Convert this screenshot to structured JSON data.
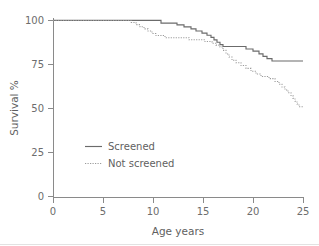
{
  "chart_data": {
    "type": "line",
    "title": "",
    "subtitle": "",
    "xlabel": "Age years",
    "ylabel": "Survival %",
    "xlim": [
      0,
      25
    ],
    "ylim": [
      0,
      100
    ],
    "xticks": [
      0,
      5,
      10,
      15,
      20,
      25
    ],
    "yticks": [
      0,
      25,
      50,
      75,
      100
    ],
    "xtick_labels": [
      "0",
      "5",
      "10",
      "15",
      "20",
      "25"
    ],
    "ytick_labels": [
      "0",
      "25",
      "50",
      "75",
      "100"
    ],
    "grid": false,
    "legend_position": "center-left",
    "style": "kaplan-meier step curves",
    "series": [
      {
        "name": "Screened",
        "line_style": "solid",
        "color": "#6b6b6b",
        "final_value": 77,
        "points": [
          [
            0,
            100
          ],
          [
            10.8,
            100
          ],
          [
            10.8,
            98.5
          ],
          [
            12.4,
            98.5
          ],
          [
            12.4,
            97.5
          ],
          [
            13.1,
            97.5
          ],
          [
            13.1,
            96.3
          ],
          [
            13.8,
            96.3
          ],
          [
            13.8,
            95.2
          ],
          [
            14.3,
            95.2
          ],
          [
            14.3,
            94.0
          ],
          [
            14.9,
            94.0
          ],
          [
            14.9,
            92.8
          ],
          [
            15.4,
            92.8
          ],
          [
            15.4,
            91.6
          ],
          [
            15.8,
            91.6
          ],
          [
            15.8,
            90.4
          ],
          [
            16.1,
            90.4
          ],
          [
            16.1,
            89.0
          ],
          [
            16.4,
            89.0
          ],
          [
            16.4,
            87.6
          ],
          [
            16.7,
            87.6
          ],
          [
            16.7,
            86.3
          ],
          [
            17.0,
            86.3
          ],
          [
            17.0,
            85.2
          ],
          [
            19.3,
            85.2
          ],
          [
            19.3,
            83.8
          ],
          [
            20.0,
            83.8
          ],
          [
            20.0,
            82.6
          ],
          [
            20.6,
            82.6
          ],
          [
            20.6,
            81.0
          ],
          [
            21.0,
            81.0
          ],
          [
            21.0,
            79.6
          ],
          [
            21.4,
            79.6
          ],
          [
            21.4,
            78.3
          ],
          [
            21.9,
            78.3
          ],
          [
            21.9,
            77.0
          ],
          [
            25.0,
            77.0
          ]
        ]
      },
      {
        "name": "Not screened",
        "line_style": "dotted",
        "color": "#9a9a9a",
        "final_value": 51,
        "points": [
          [
            0,
            100
          ],
          [
            7.8,
            100
          ],
          [
            7.8,
            98.8
          ],
          [
            8.3,
            98.8
          ],
          [
            8.3,
            97.6
          ],
          [
            8.7,
            97.6
          ],
          [
            8.7,
            96.4
          ],
          [
            9.1,
            96.4
          ],
          [
            9.1,
            95.2
          ],
          [
            9.5,
            95.2
          ],
          [
            9.5,
            94.0
          ],
          [
            9.9,
            94.0
          ],
          [
            9.9,
            92.6
          ],
          [
            10.3,
            92.6
          ],
          [
            10.3,
            91.4
          ],
          [
            11.2,
            91.4
          ],
          [
            11.2,
            90.2
          ],
          [
            13.6,
            90.2
          ],
          [
            13.6,
            89.0
          ],
          [
            15.2,
            89.0
          ],
          [
            15.2,
            88.0
          ],
          [
            15.9,
            88.0
          ],
          [
            15.9,
            87.0
          ],
          [
            16.3,
            87.0
          ],
          [
            16.3,
            86.0
          ],
          [
            16.7,
            86.0
          ],
          [
            16.7,
            85.0
          ],
          [
            17.0,
            85.0
          ],
          [
            17.0,
            83.0
          ],
          [
            17.3,
            83.0
          ],
          [
            17.3,
            81.0
          ],
          [
            17.6,
            81.0
          ],
          [
            17.6,
            79.2
          ],
          [
            17.9,
            79.2
          ],
          [
            17.9,
            77.4
          ],
          [
            18.3,
            77.4
          ],
          [
            18.3,
            76.0
          ],
          [
            18.8,
            76.0
          ],
          [
            18.8,
            74.4
          ],
          [
            19.3,
            74.4
          ],
          [
            19.3,
            72.8
          ],
          [
            19.8,
            72.8
          ],
          [
            19.8,
            71.2
          ],
          [
            20.3,
            71.2
          ],
          [
            20.3,
            69.6
          ],
          [
            20.8,
            69.6
          ],
          [
            20.8,
            68.2
          ],
          [
            21.6,
            68.2
          ],
          [
            21.6,
            67.0
          ],
          [
            22.2,
            67.0
          ],
          [
            22.2,
            65.4
          ],
          [
            22.6,
            65.4
          ],
          [
            22.6,
            63.8
          ],
          [
            22.9,
            63.8
          ],
          [
            22.9,
            62.2
          ],
          [
            23.2,
            62.2
          ],
          [
            23.2,
            60.6
          ],
          [
            23.5,
            60.6
          ],
          [
            23.5,
            59.0
          ],
          [
            23.8,
            59.0
          ],
          [
            23.8,
            57.4
          ],
          [
            24.0,
            57.4
          ],
          [
            24.0,
            55.8
          ],
          [
            24.2,
            55.8
          ],
          [
            24.2,
            54.2
          ],
          [
            24.4,
            54.2
          ],
          [
            24.4,
            52.6
          ],
          [
            24.6,
            52.6
          ],
          [
            24.6,
            51.0
          ],
          [
            25.0,
            51.0
          ]
        ]
      }
    ]
  },
  "legend": {
    "items": [
      {
        "label": "Screened",
        "style": "solid"
      },
      {
        "label": "Not screened",
        "style": "dotted"
      }
    ]
  },
  "axes": {
    "x_title": "Age years",
    "y_title": "Survival %"
  }
}
